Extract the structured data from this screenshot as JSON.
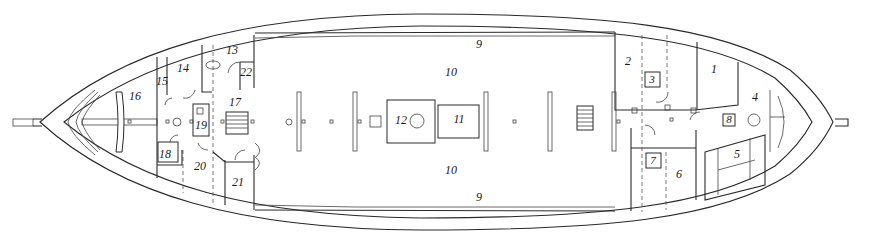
{
  "diagram": {
    "type": "ship deck plan",
    "orientation": "bow-left / stern-right",
    "line_color": "#2a2a2a",
    "background": "#ffffff",
    "labels": [
      {
        "id": "room-1",
        "text": "1"
      },
      {
        "id": "room-2",
        "text": "2"
      },
      {
        "id": "room-3",
        "text": "3"
      },
      {
        "id": "room-4",
        "text": "4"
      },
      {
        "id": "room-5",
        "text": "5"
      },
      {
        "id": "room-6",
        "text": "6"
      },
      {
        "id": "room-7",
        "text": "7"
      },
      {
        "id": "room-8",
        "text": "8"
      },
      {
        "id": "area-9-top",
        "text": "9"
      },
      {
        "id": "area-9-bottom",
        "text": "9"
      },
      {
        "id": "area-10-top",
        "text": "10"
      },
      {
        "id": "area-10-bottom",
        "text": "10"
      },
      {
        "id": "hatch-11",
        "text": "11"
      },
      {
        "id": "hatch-12",
        "text": "12"
      },
      {
        "id": "room-13",
        "text": "13"
      },
      {
        "id": "room-14",
        "text": "14"
      },
      {
        "id": "room-15",
        "text": "15"
      },
      {
        "id": "room-16",
        "text": "16"
      },
      {
        "id": "room-17",
        "text": "17"
      },
      {
        "id": "room-18",
        "text": "18"
      },
      {
        "id": "room-19",
        "text": "19"
      },
      {
        "id": "room-20",
        "text": "20"
      },
      {
        "id": "room-21",
        "text": "21"
      },
      {
        "id": "room-22",
        "text": "22"
      }
    ]
  }
}
